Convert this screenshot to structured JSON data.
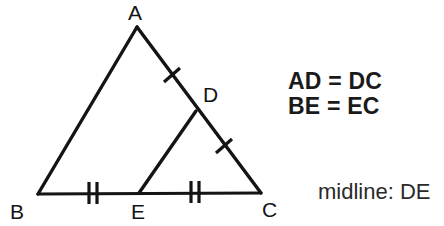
{
  "figure": {
    "stroke_color": "#141414",
    "background_color": "#ffffff",
    "stroke_width": 3,
    "vertices": [
      {
        "key": "A",
        "label": "A",
        "x": 137,
        "y": 27
      },
      {
        "key": "B",
        "label": "B",
        "x": 38,
        "y": 194
      },
      {
        "key": "C",
        "label": "C",
        "x": 261,
        "y": 193
      },
      {
        "key": "D",
        "label": "D",
        "x": 196,
        "y": 111
      },
      {
        "key": "E",
        "label": "E",
        "x": 139,
        "y": 193
      }
    ],
    "segments": [
      {
        "name": "AB",
        "from": "A",
        "to": "B"
      },
      {
        "name": "AC",
        "from": "A",
        "to": "C"
      },
      {
        "name": "BC",
        "from": "B",
        "to": "C"
      },
      {
        "name": "DE",
        "from": "D",
        "to": "E"
      }
    ],
    "tick_marks": [
      {
        "on": "AD",
        "count": 1,
        "x": 172,
        "y": 75
      },
      {
        "on": "DC",
        "count": 1,
        "x": 224,
        "y": 146
      },
      {
        "on": "BE",
        "count": 2,
        "x": 93,
        "y": 193
      },
      {
        "on": "EC",
        "count": 2,
        "x": 195,
        "y": 192
      }
    ]
  },
  "notes": {
    "equality_1": "AD = DC",
    "equality_2": "BE = EC",
    "midline": "midline: DE"
  }
}
